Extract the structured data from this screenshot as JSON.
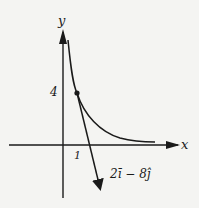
{
  "diagram": {
    "axes": {
      "x_label": "x",
      "y_label": "y"
    },
    "ticks": {
      "x_tick": "1",
      "y_tick": "4"
    },
    "point": {
      "x": 1,
      "y": 4
    },
    "curve": "decaying curve through (1,4), asymptotic to x-axis",
    "tangent_vector_label": "2ī − 8ĵ",
    "colors": {
      "ink": "#1a1a1a",
      "background": "#f4f4f2"
    }
  }
}
